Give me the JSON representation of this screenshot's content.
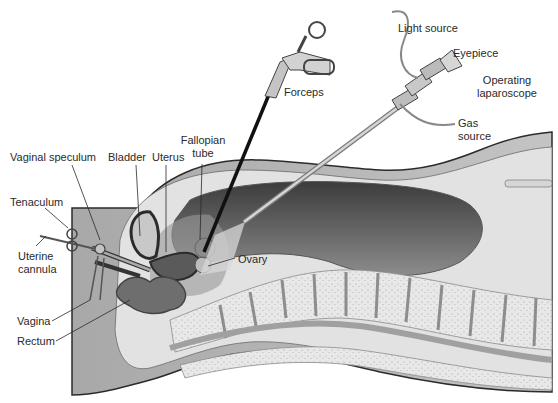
{
  "figure": {
    "colors": {
      "background": "#ffffff",
      "body_wall": "#b9b9b9",
      "skin_outline": "#2b2b2b",
      "abdominal_cavity_dark": "#4a4a4a",
      "abdominal_cavity_light": "#8a8a8a",
      "spine_bone": "#e6e6e6",
      "disc": "#9a9a9a",
      "soft_tissue": "#d4d4d4",
      "instrument_metal": "#bdbdbd",
      "label_text": "#2a2a2a"
    }
  },
  "labels": {
    "light_source": "Light source",
    "eyepiece": "Eyepiece",
    "operating_laparoscope_line1": "Operating",
    "operating_laparoscope_line2": "laparoscope",
    "forceps": "Forceps",
    "gas_source_line1": "Gas",
    "gas_source_line2": "source",
    "fallopian_tube_line1": "Fallopian",
    "fallopian_tube_line2": "tube",
    "vaginal_speculum": "Vaginal speculum",
    "bladder": "Bladder",
    "uterus": "Uterus",
    "tenaculum": "Tenaculum",
    "uterine_cannula_line1": "Uterine",
    "uterine_cannula_line2": "cannula",
    "ovary": "Ovary",
    "vagina": "Vagina",
    "rectum": "Rectum"
  }
}
